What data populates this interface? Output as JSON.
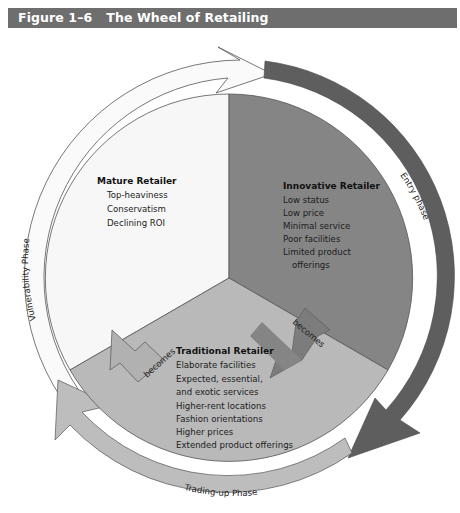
{
  "header": {
    "figure_number": "Figure 1–6",
    "title": "The Wheel of Retailing"
  },
  "colors": {
    "title_bar": "#6e6e6e",
    "mature_sector": "#f7f7f7",
    "innovative_sector": "#858585",
    "traditional_sector": "#b9b9b9",
    "entry_phase_ring": "#5e5e5e",
    "trading_up_ring": "#bdbdbd",
    "vulnerability_ring": "#fafafa",
    "outline": "#555555"
  },
  "wheel": {
    "sectors": [
      {
        "id": "mature",
        "heading": "Mature Retailer",
        "items": [
          "Top-heaviness",
          "Conservatism",
          "Declining ROI"
        ]
      },
      {
        "id": "innovative",
        "heading": "Innovative Retailer",
        "items": [
          "Low status",
          "Low price",
          "Minimal service",
          "Poor facilities",
          "Limited product",
          "offerings"
        ]
      },
      {
        "id": "traditional",
        "heading": "Traditional Retailer",
        "items": [
          "Elaborate facilities",
          "Expected, essential,",
          "and exotic services",
          "Higher-rent locations",
          "Fashion orientations",
          "Higher prices",
          "Extended product offerings"
        ]
      }
    ],
    "transitions": [
      {
        "from": "innovative",
        "to": "traditional",
        "label": "becomes"
      },
      {
        "from": "traditional",
        "to": "mature",
        "label": "becomes"
      }
    ],
    "phases": [
      {
        "id": "entry",
        "label": "Entry phase"
      },
      {
        "id": "trading-up",
        "label": "Trading-up Phase"
      },
      {
        "id": "vulnerability",
        "label": "Vulnerability Phase"
      }
    ]
  }
}
